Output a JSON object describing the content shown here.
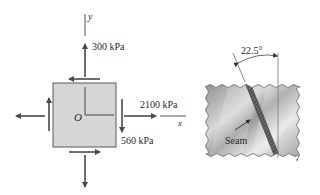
{
  "figure": {
    "stress_element": {
      "axis_x_label": "x",
      "axis_y_label": "y",
      "origin_label": "O",
      "normal_stress_y": "300 kPa",
      "normal_stress_x": "2100 kPa",
      "shear_stress": "560 kPa",
      "element_fill": "#d6d6d6",
      "arrow_color": "#4a4a4a"
    },
    "welded_plate": {
      "angle_label": "22.5°",
      "seam_label": "Seam",
      "plate_color_dark": "#8f8f8f",
      "plate_color_light": "#e4e4e4"
    }
  }
}
